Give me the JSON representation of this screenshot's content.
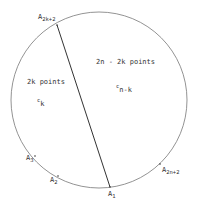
{
  "diagram": {
    "colors": {
      "circle": "#777777",
      "chord": "#333333",
      "text": "#333333",
      "background": "#ffffff"
    },
    "circle": {
      "cx": 99,
      "cy": 100,
      "r": 88
    },
    "chord": {
      "from": "A_{2k+2}",
      "to": "A_1"
    },
    "points": [
      {
        "name": "A",
        "sub": "2k+2",
        "dot": [
          57,
          25
        ],
        "label": [
          38,
          19
        ]
      },
      {
        "name": "A",
        "sub": "1",
        "dot": [
          110,
          187
        ],
        "label": [
          108,
          196
        ]
      },
      {
        "name": "A",
        "sub": "2",
        "dot": [
          58,
          176
        ],
        "label": [
          50,
          182
        ]
      },
      {
        "name": "A",
        "sub": "3",
        "dot": [
          35,
          156
        ],
        "label": [
          26,
          160
        ]
      },
      {
        "name": "A",
        "sub": "2n+2",
        "dot": [
          160,
          164
        ],
        "label": [
          162,
          172
        ]
      }
    ],
    "region_labels": [
      {
        "text": "2k points",
        "pos": [
          27,
          84
        ]
      },
      {
        "text": "2n - 2k points",
        "pos": [
          96,
          64
        ]
      }
    ],
    "constants": [
      {
        "symbol": "c",
        "sub": "k",
        "pos": [
          37,
          104
        ]
      },
      {
        "symbol": "c",
        "sub": "n-k",
        "pos": [
          116,
          90
        ]
      }
    ]
  }
}
